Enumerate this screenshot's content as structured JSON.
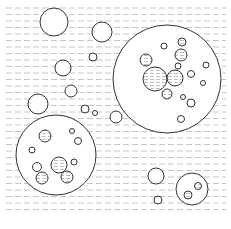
{
  "diagram": {
    "title": "",
    "width": 231,
    "height": 229,
    "colors": {
      "background": "#ffffff",
      "stroke": "#333333",
      "dash": "#b8b8b8",
      "fill_hatch": "#c8c8c8"
    },
    "background_lines": {
      "y_start": 8,
      "y_end": 212,
      "spacing": 6.5,
      "x_start": 6,
      "x_end": 226,
      "dash": "6 3"
    },
    "large_circles": [
      {
        "id": "right-cluster",
        "cx": 167,
        "cy": 79,
        "r": 54
      },
      {
        "id": "left-cluster",
        "cx": 56,
        "cy": 155,
        "r": 40
      },
      {
        "id": "bottom-right-cluster",
        "cx": 192,
        "cy": 189,
        "r": 16
      }
    ],
    "circles": [
      {
        "cx": 54,
        "cy": 22,
        "r": 14,
        "filled": false
      },
      {
        "cx": 102,
        "cy": 32,
        "r": 10,
        "filled": false
      },
      {
        "cx": 93,
        "cy": 57,
        "r": 4,
        "filled": false
      },
      {
        "cx": 63,
        "cy": 68,
        "r": 8,
        "filled": false
      },
      {
        "cx": 71,
        "cy": 91,
        "r": 6,
        "filled": false
      },
      {
        "cx": 38,
        "cy": 104,
        "r": 10,
        "filled": false
      },
      {
        "cx": 85,
        "cy": 109,
        "r": 4,
        "filled": false
      },
      {
        "cx": 95,
        "cy": 113,
        "r": 2.5,
        "filled": false
      },
      {
        "cx": 116,
        "cy": 117,
        "r": 6,
        "filled": false
      },
      {
        "cx": 156,
        "cy": 176,
        "r": 8,
        "filled": false
      },
      {
        "cx": 158,
        "cy": 200,
        "r": 4,
        "filled": false
      },
      {
        "cx": 164,
        "cy": 46,
        "r": 3,
        "filled": false
      },
      {
        "cx": 182,
        "cy": 42,
        "r": 4,
        "filled": true
      },
      {
        "cx": 181,
        "cy": 55,
        "r": 6,
        "filled": true
      },
      {
        "cx": 146,
        "cy": 60,
        "r": 6,
        "filled": true
      },
      {
        "cx": 178,
        "cy": 66,
        "r": 3,
        "filled": false
      },
      {
        "cx": 155,
        "cy": 79,
        "r": 12,
        "filled": true
      },
      {
        "cx": 175,
        "cy": 78,
        "r": 8,
        "filled": true
      },
      {
        "cx": 206,
        "cy": 65,
        "r": 3,
        "filled": false
      },
      {
        "cx": 191,
        "cy": 74,
        "r": 3.5,
        "filled": false
      },
      {
        "cx": 203,
        "cy": 83,
        "r": 2.5,
        "filled": false
      },
      {
        "cx": 167,
        "cy": 94,
        "r": 5,
        "filled": true
      },
      {
        "cx": 183,
        "cy": 97,
        "r": 2.5,
        "filled": false
      },
      {
        "cx": 191,
        "cy": 103,
        "r": 4,
        "filled": false
      },
      {
        "cx": 181,
        "cy": 119,
        "r": 3.5,
        "filled": false
      },
      {
        "cx": 45,
        "cy": 136,
        "r": 6,
        "filled": true
      },
      {
        "cx": 72,
        "cy": 131,
        "r": 2.5,
        "filled": false
      },
      {
        "cx": 78,
        "cy": 141,
        "r": 3.5,
        "filled": false
      },
      {
        "cx": 32,
        "cy": 150,
        "r": 3,
        "filled": false
      },
      {
        "cx": 59,
        "cy": 165,
        "r": 8,
        "filled": true
      },
      {
        "cx": 37,
        "cy": 167,
        "r": 4.5,
        "filled": false
      },
      {
        "cx": 74,
        "cy": 162,
        "r": 3,
        "filled": false
      },
      {
        "cx": 42,
        "cy": 178,
        "r": 6,
        "filled": true
      },
      {
        "cx": 67,
        "cy": 177,
        "r": 6,
        "filled": true
      },
      {
        "cx": 198,
        "cy": 186,
        "r": 3.5,
        "filled": true
      },
      {
        "cx": 188,
        "cy": 195,
        "r": 4,
        "filled": true
      }
    ]
  }
}
